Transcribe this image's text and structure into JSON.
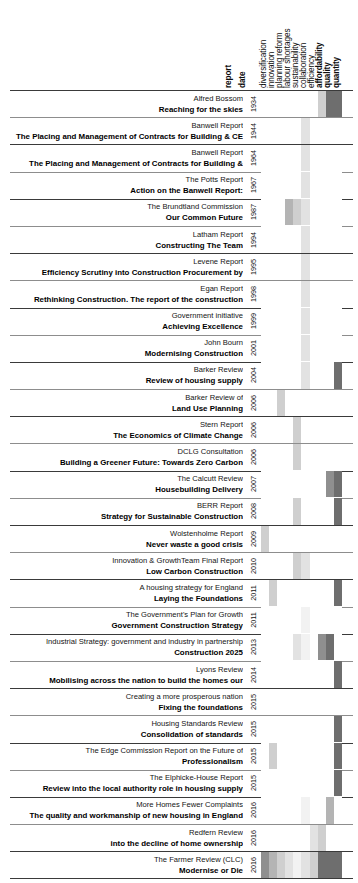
{
  "chart_data": {
    "type": "heatmap",
    "title": "",
    "xlabel": "",
    "ylabel": "",
    "grid": false,
    "legend_position": "none",
    "orientation": "rows = reports (chronological), columns = themes",
    "value_scale": {
      "0": "#ffffff",
      "1": "#f2f2f2",
      "2": "#e2e2e2",
      "3": "#cfcfcf",
      "4": "#b4b4b4",
      "5": "#8f8f8f",
      "6": "#6e6e6e",
      "7": "#575757"
    },
    "columns": [
      "report",
      "date",
      "diversification",
      "innovation",
      "planning reform",
      "labour shortages",
      "sustainability",
      "collaboration",
      "efficiency",
      "affordability",
      "quality",
      "quantity"
    ],
    "theme_columns": [
      "diversification",
      "innovation",
      "planning reform",
      "labour shortages",
      "sustainability",
      "collaboration",
      "efficiency",
      "affordability",
      "quality",
      "quantity"
    ],
    "bold_columns": [
      "report",
      "date",
      "affordability",
      "quality",
      "quantity"
    ],
    "rows": [
      {
        "source": "Alfred Bossom",
        "title": "Reaching for the skies",
        "date": "1934",
        "values": [
          0,
          0,
          0,
          0,
          0,
          0,
          0,
          3,
          6,
          6
        ]
      },
      {
        "source": "Banwell Report",
        "title": "The Placing and Management of Contracts for Building & CE",
        "date": "1944",
        "values": [
          0,
          0,
          0,
          0,
          0,
          2,
          0,
          0,
          0,
          0
        ]
      },
      {
        "source": "Banwell Report",
        "title": "The Placing and Management of Contracts for Building &",
        "date": "1964",
        "values": [
          0,
          0,
          0,
          0,
          0,
          2,
          0,
          0,
          0,
          0
        ]
      },
      {
        "source": "The Potts Report",
        "title": "Action on the Banwell Report:",
        "date": "1967",
        "values": [
          0,
          0,
          0,
          0,
          0,
          2,
          0,
          0,
          0,
          0
        ]
      },
      {
        "source": "The Brundtland Commission",
        "title": "Our Common Future",
        "date": "1987",
        "values": [
          0,
          0,
          0,
          4,
          3,
          2,
          0,
          0,
          0,
          0
        ]
      },
      {
        "source": "Latham Report",
        "title": "Constructing The Team",
        "date": "1994",
        "values": [
          0,
          0,
          0,
          0,
          0,
          2,
          0,
          0,
          0,
          0
        ]
      },
      {
        "source": "Levene Report",
        "title": "Efficiency Scrutiny into Construction Procurement by",
        "date": "1995",
        "values": [
          0,
          0,
          0,
          0,
          0,
          2,
          0,
          0,
          0,
          0
        ]
      },
      {
        "source": "Egan Report",
        "title": "Rethinking Construction. The report of the construction",
        "date": "1998",
        "values": [
          0,
          0,
          0,
          0,
          0,
          2,
          0,
          0,
          0,
          0
        ]
      },
      {
        "source": "Government initiative",
        "title": "Achieving Excellence",
        "date": "1999",
        "values": [
          0,
          0,
          0,
          0,
          0,
          2,
          0,
          0,
          0,
          0
        ]
      },
      {
        "source": "John Bourn",
        "title": "Modernising Construction",
        "date": "2001",
        "values": [
          0,
          0,
          0,
          0,
          0,
          2,
          0,
          0,
          0,
          0
        ]
      },
      {
        "source": "Barker Review",
        "title": "Review of housing supply",
        "date": "2004",
        "values": [
          0,
          0,
          0,
          0,
          0,
          2,
          0,
          0,
          0,
          6
        ]
      },
      {
        "source": "Barker Review of",
        "title": "Land Use Planning",
        "date": "2006",
        "values": [
          0,
          0,
          3,
          0,
          0,
          0,
          0,
          0,
          0,
          0
        ]
      },
      {
        "source": "Stern Report",
        "title": "The Economics of Climate Change",
        "date": "2006",
        "values": [
          0,
          0,
          0,
          0,
          3,
          0,
          0,
          0,
          0,
          0
        ]
      },
      {
        "source": "DCLG Consultation",
        "title": "Building a Greener Future: Towards Zero Carbon",
        "date": "2006",
        "values": [
          0,
          0,
          0,
          0,
          3,
          0,
          0,
          0,
          0,
          0
        ]
      },
      {
        "source": "The Calcutt Review",
        "title": "Housebuilding Delivery",
        "date": "2007",
        "values": [
          0,
          0,
          0,
          0,
          0,
          0,
          0,
          0,
          5,
          6
        ]
      },
      {
        "source": "BERR Report",
        "title": "Strategy for Sustainable Construction",
        "date": "2008",
        "values": [
          0,
          0,
          0,
          0,
          3,
          0,
          0,
          0,
          0,
          6
        ]
      },
      {
        "source": "Wolstenholme Report",
        "title": "Never waste a good crisis",
        "date": "2009",
        "values": [
          3,
          0,
          0,
          0,
          0,
          0,
          0,
          0,
          0,
          0
        ]
      },
      {
        "source": "Innovation & GrowthTeam Final Report",
        "title": "Low Carbon Construction",
        "date": "2010",
        "values": [
          0,
          0,
          0,
          0,
          3,
          2,
          0,
          0,
          0,
          0
        ]
      },
      {
        "source": "A housing strategy for England",
        "title": "Laying the Foundations",
        "date": "2011",
        "values": [
          0,
          3,
          0,
          0,
          0,
          0,
          0,
          0,
          0,
          6
        ]
      },
      {
        "source": "The Government's Plan for Growth",
        "title": "Government Construction Strategy",
        "date": "2011",
        "values": [
          0,
          0,
          0,
          0,
          0,
          1,
          0,
          0,
          0,
          0
        ]
      },
      {
        "source": "Industrial Strategy: government and industry in partnership",
        "title": "Construction 2025",
        "date": "2013",
        "values": [
          0,
          0,
          0,
          0,
          2,
          1,
          0,
          5,
          6,
          0
        ]
      },
      {
        "source": "Lyons Review",
        "title": "Mobilising across the nation to build the homes our",
        "date": "2014",
        "values": [
          0,
          0,
          0,
          0,
          0,
          0,
          0,
          0,
          0,
          6
        ]
      },
      {
        "source": "Creating a more prosperous nation",
        "title": "Fixing the foundations",
        "date": "2015",
        "values": [
          0,
          0,
          0,
          0,
          0,
          0,
          0,
          0,
          0,
          0
        ]
      },
      {
        "source": "Housing Standards Review",
        "title": "Consolidation of standards",
        "date": "2015",
        "values": [
          0,
          0,
          0,
          0,
          0,
          0,
          0,
          0,
          0,
          6
        ]
      },
      {
        "source": "The Edge Commission Report on the Future of",
        "title": "Professionalism",
        "date": "2015",
        "values": [
          0,
          3,
          0,
          0,
          0,
          0,
          0,
          0,
          0,
          6
        ]
      },
      {
        "source": "The Elphicke-House Report",
        "title": "Review into the local authority role in housing supply",
        "date": "2015",
        "values": [
          0,
          0,
          0,
          0,
          0,
          0,
          0,
          0,
          0,
          6
        ]
      },
      {
        "source": "More Homes Fewer Complaints",
        "title": "The quality and workmanship of new housing in England",
        "date": "2016",
        "values": [
          0,
          0,
          0,
          0,
          0,
          1,
          0,
          0,
          4,
          0
        ]
      },
      {
        "source": "Redfern Review",
        "title": "into the decline of home ownership",
        "date": "2016",
        "values": [
          0,
          0,
          0,
          0,
          0,
          0,
          2,
          3,
          0,
          0
        ]
      },
      {
        "source": "The Farmer Review (CLC)",
        "title": "Modernise or Die",
        "date": "2016",
        "values": [
          5,
          4,
          3,
          2,
          1,
          2,
          3,
          6,
          6,
          6
        ]
      }
    ]
  }
}
